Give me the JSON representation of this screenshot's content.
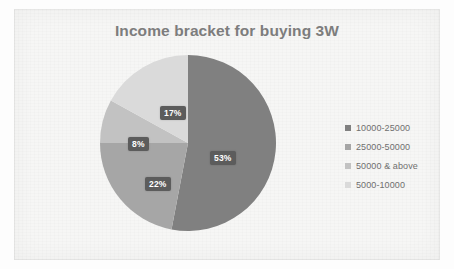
{
  "chart": {
    "title": "Income bracket for buying 3W",
    "background_color": "#f6f6f5",
    "title_color": "#7d7d7d",
    "label_box_color": "#5c5c5c",
    "label_text_color": "#ffffff"
  },
  "chart_data": {
    "type": "pie",
    "title": "Income bracket for buying 3W",
    "categories": [
      "10000-25000",
      "25000-50000",
      "50000 & above",
      "5000-10000"
    ],
    "values": [
      53,
      22,
      8,
      17
    ],
    "value_labels": [
      "53%",
      "22%",
      "8%",
      "17%"
    ],
    "colors": [
      "#808080",
      "#a6a6a6",
      "#c2c2c2",
      "#dadada"
    ],
    "legend_position": "right",
    "start_angle_deg": 0,
    "direction": "clockwise",
    "units": "percent",
    "grid": false,
    "xlabel": "",
    "ylabel": ""
  },
  "legend": {
    "items": [
      {
        "label": "10000-25000",
        "color": "#808080"
      },
      {
        "label": "25000-50000",
        "color": "#a6a6a6"
      },
      {
        "label": "50000 & above",
        "color": "#c2c2c2"
      },
      {
        "label": "5000-10000",
        "color": "#dadada"
      }
    ]
  }
}
